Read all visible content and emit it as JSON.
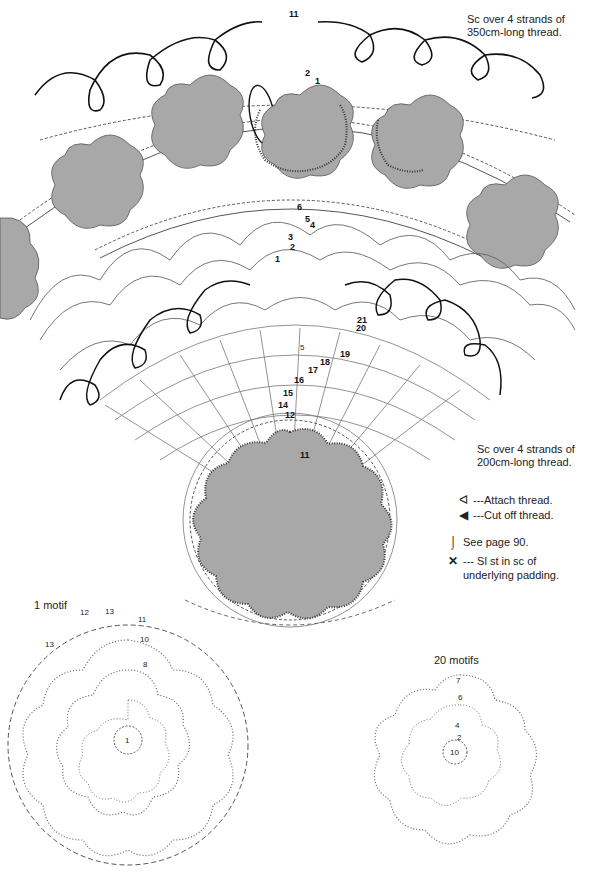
{
  "diagram": {
    "colors": {
      "motif_fill": "#a8a8a8",
      "line": "#333333",
      "background": "#ffffff"
    },
    "annotations": {
      "top_note_line1": "Sc over 4 strands of",
      "top_note_line2": "350cm-long thread.",
      "mid_note_line1": "Sc over 4 strands of",
      "mid_note_line2": "200cm-long thread."
    },
    "legend": [
      {
        "icon": "attach-thread-icon",
        "glyph": "ᐊ",
        "label": "---Attach thread."
      },
      {
        "icon": "cut-thread-icon",
        "glyph": "◀",
        "label": "---Cut off thread."
      },
      {
        "icon": "see-page-icon",
        "glyph": "⌡",
        "label": "See page 90."
      },
      {
        "icon": "slip-stitch-icon",
        "glyph": "✕",
        "label": "--- Sl st in sc of"
      },
      {
        "icon": "",
        "glyph": "",
        "label": "underlying padding."
      }
    ],
    "sub_charts": [
      {
        "label": "1 motif",
        "round_labels": [
          "1",
          "2",
          "3",
          "4",
          "5",
          "6",
          "7",
          "8",
          "9",
          "10",
          "11",
          "12",
          "13"
        ]
      },
      {
        "label": "20 motifs",
        "round_labels": [
          "1",
          "2",
          "3",
          "4",
          "5",
          "6",
          "7"
        ]
      }
    ],
    "round_numbers_fan": [
      "1",
      "2",
      "3",
      "4",
      "5",
      "6",
      "7",
      "8",
      "9",
      "10",
      "11",
      "12",
      "13",
      "14",
      "15",
      "16",
      "17",
      "18",
      "19",
      "20",
      "21"
    ]
  }
}
